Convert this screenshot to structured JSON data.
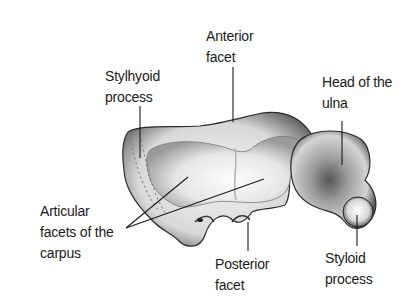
{
  "diagram": {
    "labels": [
      {
        "id": "anterior-facet",
        "lines": [
          "Anterior",
          "facet"
        ]
      },
      {
        "id": "stylhyoid-process",
        "lines": [
          "Stylhyoid",
          "process"
        ]
      },
      {
        "id": "head-of-ulna",
        "lines": [
          "Head of the",
          "ulna"
        ]
      },
      {
        "id": "articular-facets",
        "lines": [
          "Articular",
          "facets of the",
          "carpus"
        ]
      },
      {
        "id": "posterior-facet",
        "lines": [
          "Posterior",
          "facet"
        ]
      },
      {
        "id": "styloid-process",
        "lines": [
          "Styloid",
          "process"
        ]
      }
    ]
  }
}
